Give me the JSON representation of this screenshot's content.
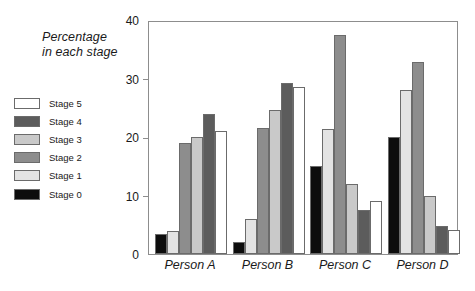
{
  "chart_data": {
    "type": "bar",
    "title": "Percentage in each stage",
    "title_lines": [
      "Percentage",
      "in each stage"
    ],
    "xlabel": "",
    "ylabel": "",
    "ylim": [
      0,
      40
    ],
    "yticks": [
      0,
      10,
      20,
      30,
      40
    ],
    "ytick_labels": [
      "0",
      "10",
      "20",
      "30",
      "40"
    ],
    "grid": false,
    "legend_position": "left-outside",
    "categories": [
      "Person A",
      "Person B",
      "Person C",
      "Person D"
    ],
    "series": [
      {
        "name": "Stage 0",
        "color": "#0d0d0d",
        "values": [
          3.4,
          2.0,
          15.0,
          20.0
        ]
      },
      {
        "name": "Stage 1",
        "color": "#e3e3e3",
        "values": [
          4.0,
          6.0,
          21.4,
          28.0
        ]
      },
      {
        "name": "Stage 2",
        "color": "#8d8d8d",
        "values": [
          19.0,
          21.6,
          37.5,
          32.8
        ]
      },
      {
        "name": "Stage 3",
        "color": "#c9c9c9",
        "values": [
          20.0,
          24.7,
          12.0,
          10.0
        ]
      },
      {
        "name": "Stage 4",
        "color": "#5c5c5c",
        "values": [
          24.0,
          29.2,
          7.6,
          4.8
        ]
      },
      {
        "name": "Stage 5",
        "color": "#ffffff",
        "values": [
          21.0,
          28.6,
          9.0,
          4.1
        ]
      }
    ],
    "legend_order": [
      "Stage 5",
      "Stage 4",
      "Stage 3",
      "Stage 2",
      "Stage 1",
      "Stage 0"
    ]
  },
  "colors": {
    "axis": "#8d8d8d",
    "bar_outline": "#6b6b6b",
    "text": "#1a1a1a",
    "background": "#ffffff"
  }
}
